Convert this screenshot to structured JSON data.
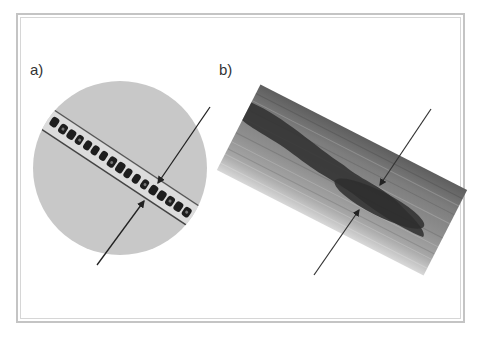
{
  "figure": {
    "panels": [
      {
        "label": "a)",
        "description": "circular micrograph of a tube containing a chain of dark cells",
        "arrows": 2
      },
      {
        "label": "b)",
        "description": "fiber with dark elongated inner core",
        "arrows": 2
      }
    ]
  },
  "colors": {
    "frame": "#c4c4c4",
    "circle_background": "#c8c8c8",
    "cells": "#1e1e1e",
    "fiber_light": "#9a9a9a",
    "fiber_dark": "#3a3a3a",
    "arrow": "#222222"
  }
}
